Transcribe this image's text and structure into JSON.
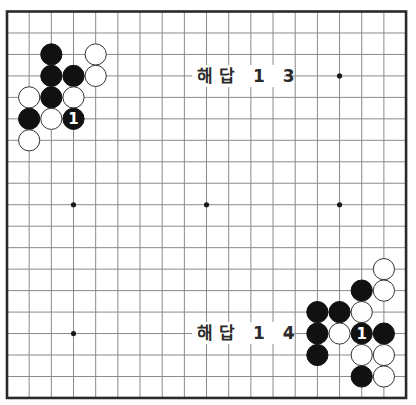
{
  "board": {
    "size": 19,
    "origin_x": 7,
    "origin_y": 11.5,
    "step_x": 22.17,
    "step_y": 21.47,
    "stone_radius": 10.6,
    "colors": {
      "grid": "#8a8a8a",
      "border": "#2a2a2a",
      "black": "#111111",
      "white": "#ffffff",
      "stone_outline": "#333333"
    },
    "star_points": [
      [
        3,
        3
      ],
      [
        9,
        3
      ],
      [
        15,
        3
      ],
      [
        3,
        9
      ],
      [
        9,
        9
      ],
      [
        15,
        9
      ],
      [
        3,
        15
      ],
      [
        9,
        15
      ],
      [
        15,
        15
      ]
    ],
    "stones": [
      {
        "col": 2,
        "row": 2,
        "color": "black"
      },
      {
        "col": 4,
        "row": 2,
        "color": "white"
      },
      {
        "col": 2,
        "row": 3,
        "color": "black"
      },
      {
        "col": 3,
        "row": 3,
        "color": "black"
      },
      {
        "col": 4,
        "row": 3,
        "color": "white"
      },
      {
        "col": 1,
        "row": 4,
        "color": "white"
      },
      {
        "col": 2,
        "row": 4,
        "color": "black"
      },
      {
        "col": 3,
        "row": 4,
        "color": "white"
      },
      {
        "col": 1,
        "row": 5,
        "color": "black"
      },
      {
        "col": 2,
        "row": 5,
        "color": "white"
      },
      {
        "col": 3,
        "row": 5,
        "color": "black",
        "label": "1"
      },
      {
        "col": 1,
        "row": 6,
        "color": "white"
      },
      {
        "col": 17,
        "row": 12,
        "color": "white"
      },
      {
        "col": 16,
        "row": 13,
        "color": "black"
      },
      {
        "col": 17,
        "row": 13,
        "color": "white"
      },
      {
        "col": 14,
        "row": 14,
        "color": "black"
      },
      {
        "col": 15,
        "row": 14,
        "color": "black"
      },
      {
        "col": 16,
        "row": 14,
        "color": "white"
      },
      {
        "col": 14,
        "row": 15,
        "color": "black"
      },
      {
        "col": 15,
        "row": 15,
        "color": "white"
      },
      {
        "col": 16,
        "row": 15,
        "color": "black",
        "label": "1"
      },
      {
        "col": 17,
        "row": 15,
        "color": "black"
      },
      {
        "col": 14,
        "row": 16,
        "color": "black"
      },
      {
        "col": 16,
        "row": 16,
        "color": "white"
      },
      {
        "col": 17,
        "row": 16,
        "color": "white"
      },
      {
        "col": 16,
        "row": 17,
        "color": "black"
      },
      {
        "col": 17,
        "row": 17,
        "color": "white"
      }
    ],
    "labels": [
      {
        "text": "해답 1 3",
        "name": "solution-13-label",
        "x": 197,
        "y": 76,
        "bg_x": 192,
        "bg_w": 92
      },
      {
        "text": "해답 1 4",
        "name": "solution-14-label",
        "x": 197,
        "y": 333,
        "bg_x": 192,
        "bg_w": 92
      }
    ]
  }
}
